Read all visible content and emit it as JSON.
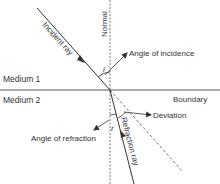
{
  "diagram": {
    "labels": {
      "incident_ray": "Incident ray",
      "normal": "Normal",
      "angle_of_incidence": "Angle of incidence",
      "medium_1": "Medium 1",
      "medium_2": "Medium 2",
      "boundary": "Boundary",
      "deviation": "Deviation",
      "refraction_ray": "Refraction ray",
      "angle_of_refraction": "Angle of refraction",
      "i": "i",
      "r": "r"
    },
    "colors": {
      "line": "#333333",
      "text": "#333333",
      "background": "#ffffff"
    }
  }
}
